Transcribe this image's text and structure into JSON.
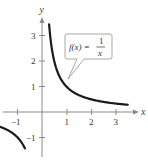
{
  "chart_data": {
    "type": "line",
    "title": "",
    "xlabel": "x",
    "ylabel": "y",
    "xlim": [
      -1.7,
      3.9
    ],
    "ylim": [
      -1.9,
      4.4
    ],
    "grid": false,
    "x_ticks": [
      -1,
      1,
      2,
      3
    ],
    "y_ticks": [
      -1,
      1,
      2,
      3
    ],
    "x_tick_labels": [
      "−1",
      "1",
      "2",
      "3"
    ],
    "y_tick_labels": [
      "−1",
      "1",
      "2",
      "3"
    ],
    "series": [
      {
        "name": "f(x) = 1/x",
        "function": "1/x",
        "branches": [
          {
            "x": [
              0.29,
              0.35,
              0.4,
              0.5,
              0.6,
              0.75,
              1.0,
              1.25,
              1.5,
              2.0,
              2.5,
              3.0,
              3.5
            ],
            "y": [
              3.45,
              2.86,
              2.5,
              2.0,
              1.67,
              1.33,
              1.0,
              0.8,
              0.67,
              0.5,
              0.4,
              0.33,
              0.29
            ]
          },
          {
            "x": [
              -1.7,
              -1.5,
              -1.25,
              -1.0,
              -0.85,
              -0.7
            ],
            "y": [
              -0.59,
              -0.67,
              -0.8,
              -1.0,
              -1.18,
              -1.43
            ]
          }
        ]
      }
    ],
    "annotations": [
      {
        "text": "f(x) = 1/x",
        "type": "callout",
        "points_to": [
          1.0,
          1.0
        ]
      }
    ]
  },
  "labels": {
    "x_axis": "x",
    "y_axis": "y",
    "x_ticks": [
      "−1",
      "1",
      "2",
      "3"
    ],
    "y_ticks": [
      "3",
      "2",
      "1",
      "−1"
    ],
    "callout_lhs": "f(x) =",
    "callout_num": "1",
    "callout_den": "x"
  }
}
